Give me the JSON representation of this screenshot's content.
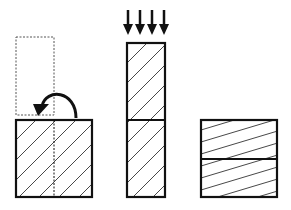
{
  "diagram": {
    "colors": {
      "stroke": "#111111",
      "background": "#ffffff",
      "hatch": "#333333"
    },
    "steps": [
      {
        "id": "step-1",
        "label": "fold",
        "elements": [
          "dashed-ghost-rect",
          "curved-fold-arrow",
          "hatched-square-with-fold-line"
        ]
      },
      {
        "id": "step-2",
        "label": "press",
        "elements": [
          "four-down-arrows",
          "stacked-column-two-halves"
        ]
      },
      {
        "id": "step-3",
        "label": "result",
        "elements": [
          "square-split-horizontally"
        ]
      }
    ],
    "arrow_count": 4
  }
}
